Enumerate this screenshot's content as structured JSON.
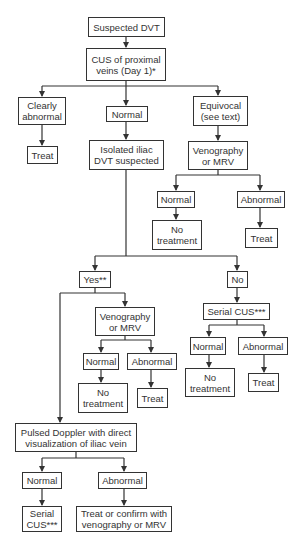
{
  "diagram": {
    "type": "flowchart",
    "title": "Suspected DVT",
    "nodes": {
      "start": "Suspected DVT",
      "cus_proximal": "CUS of proximal\nveins (Day 1)*",
      "clearly_abnormal": "Clearly\nabnormal",
      "normal_1": "Normal",
      "equivocal": "Equivocal\n(see text)",
      "treat_left": "Treat",
      "isolated_iliac": "Isolated iliac\nDVT suspected",
      "venography_right": "Venography\nor MRV",
      "vr_normal": "Normal",
      "vr_abnormal": "Abnormal",
      "vr_no_treatment": "No\ntreatment",
      "vr_treat": "Treat",
      "yes": "Yes**",
      "no": "No",
      "venography_yes": "Venography\nor MRV",
      "vy_normal": "Normal",
      "vy_abnormal": "Abnormal",
      "vy_no_treatment": "No\ntreatment",
      "vy_treat": "Treat",
      "serial_cus_no": "Serial CUS***",
      "sc_normal": "Normal",
      "sc_abnormal": "Abnormal",
      "sc_no_treatment": "No\ntreatment",
      "sc_treat": "Treat",
      "pulsed_doppler": "Pulsed Doppler with direct\nvisualization of iliac vein",
      "pd_normal": "Normal",
      "pd_abnormal": "Abnormal",
      "pd_serial_cus": "Serial\nCUS***",
      "pd_treat_confirm": "Treat or confirm with\nvenography or MRV"
    },
    "edges": [
      [
        "start",
        "cus_proximal"
      ],
      [
        "cus_proximal",
        "clearly_abnormal"
      ],
      [
        "cus_proximal",
        "normal_1"
      ],
      [
        "cus_proximal",
        "equivocal"
      ],
      [
        "clearly_abnormal",
        "treat_left"
      ],
      [
        "normal_1",
        "isolated_iliac"
      ],
      [
        "equivocal",
        "venography_right"
      ],
      [
        "venography_right",
        "vr_normal"
      ],
      [
        "venography_right",
        "vr_abnormal"
      ],
      [
        "vr_normal",
        "vr_no_treatment"
      ],
      [
        "vr_abnormal",
        "vr_treat"
      ],
      [
        "isolated_iliac",
        "yes"
      ],
      [
        "isolated_iliac",
        "no"
      ],
      [
        "yes",
        "venography_yes"
      ],
      [
        "yes",
        "pulsed_doppler"
      ],
      [
        "venography_yes",
        "vy_normal"
      ],
      [
        "venography_yes",
        "vy_abnormal"
      ],
      [
        "vy_normal",
        "vy_no_treatment"
      ],
      [
        "vy_abnormal",
        "vy_treat"
      ],
      [
        "no",
        "serial_cus_no"
      ],
      [
        "serial_cus_no",
        "sc_normal"
      ],
      [
        "serial_cus_no",
        "sc_abnormal"
      ],
      [
        "sc_normal",
        "sc_no_treatment"
      ],
      [
        "sc_abnormal",
        "sc_treat"
      ],
      [
        "pulsed_doppler",
        "pd_normal"
      ],
      [
        "pulsed_doppler",
        "pd_abnormal"
      ],
      [
        "pd_normal",
        "pd_serial_cus"
      ],
      [
        "pd_abnormal",
        "pd_treat_confirm"
      ]
    ],
    "colors": {
      "line": "#333333",
      "text": "#333333",
      "background": "#ffffff"
    }
  }
}
